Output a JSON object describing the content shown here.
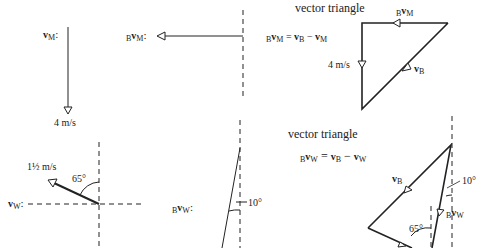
{
  "diagram": {
    "panel_top": {
      "vM_label": {
        "prefix": "",
        "symbol": "v",
        "sub": "M",
        "suffix": ":"
      },
      "vM_magnitude": "4 m/s",
      "BvM_label": {
        "prefix": "B",
        "symbol": "v",
        "sub": "M",
        "suffix": ":"
      },
      "triangle_title": "vector triangle",
      "equation": {
        "lhs_prefix": "B",
        "lhs_symbol": "v",
        "lhs_sub": "M",
        "eq": " = ",
        "a": "v",
        "a_sub": "B",
        "minus": " − ",
        "b": "v",
        "b_sub": "M"
      },
      "side_labels": {
        "top": {
          "prefix": "B",
          "symbol": "v",
          "sub": "M"
        },
        "left": "4 m/s",
        "hyp": {
          "symbol": "v",
          "sub": "B"
        }
      }
    },
    "panel_bottom": {
      "vW_label": {
        "symbol": "v",
        "sub": "W",
        "suffix": ":"
      },
      "vW_magnitude": "1½ m/s",
      "vW_angle": "65°",
      "BvW_label": {
        "prefix": "B",
        "symbol": "v",
        "sub": "W",
        "suffix": ":"
      },
      "BvW_angle": "10°",
      "triangle_title": "vector triangle",
      "equation": {
        "lhs_prefix": "B",
        "lhs_symbol": "v",
        "lhs_sub": "W",
        "eq": " = ",
        "a": "v",
        "a_sub": "B",
        "minus": " − ",
        "b": "v",
        "b_sub": "W"
      },
      "side_labels": {
        "vB": {
          "symbol": "v",
          "sub": "B"
        },
        "BvW": {
          "prefix": "B",
          "symbol": "v",
          "sub": "W"
        },
        "angle10": "10°",
        "angle65": "65°"
      }
    }
  }
}
